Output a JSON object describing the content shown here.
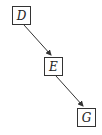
{
  "diagram": {
    "nodes": [
      {
        "id": "D",
        "label": "D",
        "x": 12,
        "y": 6
      },
      {
        "id": "E",
        "label": "E",
        "x": 44,
        "y": 57
      },
      {
        "id": "G",
        "label": "G",
        "x": 77,
        "y": 108
      }
    ],
    "edges": [
      {
        "from": "D",
        "to": "E"
      },
      {
        "from": "E",
        "to": "G"
      }
    ],
    "colors": {
      "stroke": "#333333",
      "text": "#222222"
    }
  }
}
